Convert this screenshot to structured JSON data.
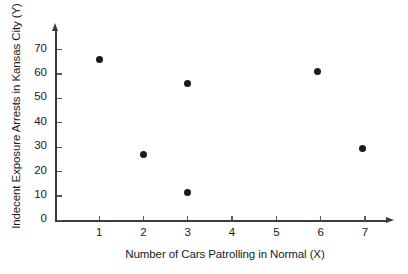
{
  "chart_data": {
    "type": "scatter",
    "title": "",
    "xlabel": "Number of Cars Patrolling in Normal (X)",
    "ylabel": "Indecent Exposure Arrests in Kansas City (Y)",
    "xlim": [
      0,
      7.5
    ],
    "ylim": [
      0,
      78
    ],
    "xticks": [
      1,
      2,
      3,
      4,
      5,
      6,
      7
    ],
    "xtick_labels": [
      "1",
      "2",
      "3",
      "4",
      "5",
      "6",
      "7"
    ],
    "yticks": [
      0,
      10,
      20,
      30,
      40,
      50,
      60,
      70
    ],
    "ytick_labels": [
      "0",
      "10",
      "20",
      "30",
      "40",
      "50",
      "60",
      "70"
    ],
    "grid": false,
    "legend": false,
    "marker": "filled-circle",
    "marker_color": "#1b1b1b",
    "axis_color": "#3a3a3a",
    "background": "#ffffff",
    "points": [
      {
        "x": 1,
        "y": 66
      },
      {
        "x": 2,
        "y": 27
      },
      {
        "x": 3,
        "y": 56
      },
      {
        "x": 3,
        "y": 11.5
      },
      {
        "x": 5.93,
        "y": 61
      },
      {
        "x": 6.94,
        "y": 29.5
      }
    ]
  }
}
